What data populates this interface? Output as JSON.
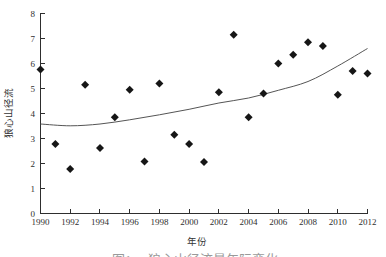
{
  "chart_data": {
    "type": "scatter",
    "title": "",
    "xlabel": "年份",
    "ylabel": "狼心山径流",
    "xlim": [
      1990,
      2012
    ],
    "ylim": [
      0,
      8
    ],
    "xticks": [
      1990,
      1992,
      1994,
      1996,
      1998,
      2000,
      2002,
      2004,
      2006,
      2008,
      2010,
      2012
    ],
    "yticks": [
      0,
      1,
      2,
      3,
      4,
      5,
      6,
      7,
      8
    ],
    "grid": false,
    "legend": "none",
    "years": [
      1990,
      1991,
      1992,
      1993,
      1994,
      1995,
      1996,
      1997,
      1998,
      1999,
      2000,
      2001,
      2002,
      2003,
      2004,
      2005,
      2006,
      2007,
      2008,
      2009,
      2010,
      2011,
      2012
    ],
    "values": [
      5.76,
      2.78,
      1.78,
      5.15,
      2.62,
      3.85,
      4.95,
      2.08,
      5.2,
      3.15,
      2.78,
      2.06,
      4.85,
      7.15,
      3.85,
      4.8,
      6.0,
      6.35,
      6.85,
      6.7,
      4.75,
      5.7,
      5.6
    ],
    "trend_line": {
      "description": "smooth rising curve fit",
      "samples": [
        [
          1990,
          3.58
        ],
        [
          1992,
          3.51
        ],
        [
          1994,
          3.58
        ],
        [
          1996,
          3.75
        ],
        [
          1998,
          3.95
        ],
        [
          2000,
          4.17
        ],
        [
          2002,
          4.42
        ],
        [
          2004,
          4.62
        ],
        [
          2006,
          4.93
        ],
        [
          2008,
          5.28
        ],
        [
          2010,
          5.9
        ],
        [
          2012,
          6.6
        ]
      ]
    },
    "marker": {
      "shape": "diamond",
      "size": 8
    },
    "colors": {
      "axis": "#2e2e2e",
      "tick_text": "#2f2f2f",
      "marker": "#161616",
      "trend": "#555555",
      "caption": "#9a9a9a"
    }
  },
  "caption": {
    "prefix": "图1",
    "text": "狼心山径流量年际变化"
  }
}
